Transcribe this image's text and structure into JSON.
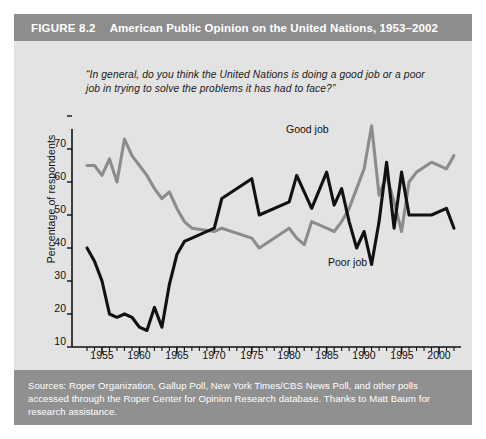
{
  "figure": {
    "number": "FIGURE 8.2",
    "title": "American Public Opinion on the United Nations, 1953–2002"
  },
  "question": "“In general, do you think the United Nations is doing a good job or a poor job in trying to solve the problems it has had to face?”",
  "axis": {
    "y_title": "Percentage of respondents",
    "y_ticks": [
      "0",
      "10",
      "20",
      "30",
      "40",
      "50",
      "60",
      "70"
    ],
    "x_ticks": [
      "1955",
      "1960",
      "1965",
      "1970",
      "1975",
      "1980",
      "1985",
      "1990",
      "1995",
      "2000"
    ]
  },
  "labels": {
    "good_job": "Good job",
    "poor_job": "Poor job"
  },
  "source": "Sources: Roper Organization, Gallup Poll, New York Times/CBS News Poll, and other polls accessed through the Roper Center for Opinion Research database. Thanks to Matt Baum for research assistance.",
  "colors": {
    "good_job_line": "#8c8c8c",
    "poor_job_line": "#111111",
    "title_bar": "#8d8d8d",
    "source_bar": "#909090",
    "plot_background": "#e3e3e3",
    "axis": "#111111"
  },
  "chart_data": {
    "type": "line",
    "title": "American Public Opinion on the United Nations, 1953–2002",
    "xlabel": "",
    "ylabel": "Percentage of respondents",
    "xlim": [
      1953,
      2002
    ],
    "ylim": [
      0,
      75
    ],
    "grid": false,
    "legend": "inline-annotations",
    "y_major_step": 10,
    "x_major_step": 5,
    "x_minor_step": 1,
    "series": [
      {
        "name": "Good job",
        "color": "#8c8c8c",
        "x": [
          1953,
          1954,
          1955,
          1956,
          1957,
          1958,
          1959,
          1960,
          1961,
          1962,
          1963,
          1964,
          1965,
          1966,
          1967,
          1970,
          1971,
          1975,
          1976,
          1980,
          1981,
          1982,
          1983,
          1985,
          1986,
          1987,
          1988,
          1989,
          1990,
          1991,
          1992,
          1993,
          1994,
          1995,
          1996,
          1997,
          1999,
          2001,
          2002
        ],
        "y": [
          55,
          55,
          52,
          57,
          50,
          63,
          58,
          55,
          52,
          48,
          45,
          47,
          42,
          38,
          36,
          35,
          36,
          33,
          30,
          36,
          33,
          31,
          38,
          36,
          35,
          38,
          42,
          48,
          54,
          67,
          46,
          52,
          44,
          35,
          50,
          53,
          56,
          54,
          58
        ]
      },
      {
        "name": "Poor job",
        "color": "#111111",
        "x": [
          1953,
          1954,
          1955,
          1956,
          1957,
          1958,
          1959,
          1960,
          1961,
          1962,
          1963,
          1964,
          1965,
          1966,
          1967,
          1970,
          1971,
          1975,
          1976,
          1980,
          1981,
          1982,
          1983,
          1985,
          1986,
          1987,
          1988,
          1989,
          1990,
          1991,
          1992,
          1993,
          1994,
          1995,
          1996,
          1997,
          1999,
          2001,
          2002
        ],
        "y": [
          30,
          26,
          20,
          10,
          9,
          10,
          9,
          6,
          5,
          12,
          6,
          19,
          28,
          32,
          33,
          36,
          45,
          51,
          40,
          44,
          52,
          47,
          42,
          53,
          43,
          48,
          38,
          30,
          35,
          25,
          38,
          56,
          36,
          53,
          40,
          40,
          40,
          42,
          36
        ]
      }
    ]
  }
}
